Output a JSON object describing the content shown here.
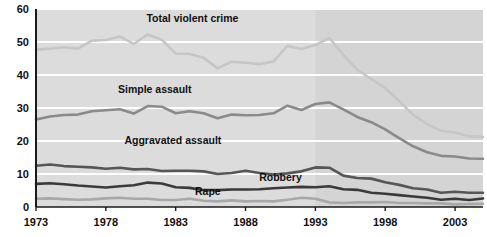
{
  "chart_data": {
    "type": "line",
    "title": "",
    "subtitle": "",
    "xlabel": "",
    "ylabel": "",
    "xlim": [
      1973,
      2005
    ],
    "ylim": [
      0,
      60
    ],
    "grid": true,
    "legend_position": "inline-annotations",
    "x_ticks": [
      "1973",
      "1978",
      "1983",
      "1988",
      "1993",
      "1998",
      "2003"
    ],
    "x_tick_values": [
      1973,
      1978,
      1983,
      1988,
      1993,
      1998,
      2003
    ],
    "y_ticks": [
      "0",
      "10",
      "20",
      "30",
      "40",
      "50",
      "60"
    ],
    "y_tick_values": [
      0,
      10,
      20,
      30,
      40,
      50,
      60
    ],
    "x": [
      1973,
      1974,
      1975,
      1976,
      1977,
      1978,
      1979,
      1980,
      1981,
      1982,
      1983,
      1984,
      1985,
      1986,
      1987,
      1988,
      1989,
      1990,
      1991,
      1992,
      1993,
      1994,
      1995,
      1996,
      1997,
      1998,
      1999,
      2000,
      2001,
      2002,
      2003,
      2004,
      2005
    ],
    "series": [
      {
        "name": "Total violent crime",
        "color": "#c6c6c6",
        "label_x": 1984.2,
        "label_y": 56.2,
        "values": [
          47.7,
          48.0,
          48.4,
          48.0,
          50.4,
          50.6,
          51.7,
          49.4,
          52.3,
          50.7,
          46.5,
          46.4,
          45.2,
          42.0,
          44.0,
          43.7,
          43.3,
          44.1,
          48.8,
          47.9,
          49.1,
          51.2,
          46.1,
          41.6,
          38.8,
          36.0,
          32.1,
          27.9,
          25.1,
          23.1,
          22.6,
          21.4,
          21.2
        ]
      },
      {
        "name": "Simple assault",
        "color": "#8a8a8a",
        "label_x": 1981.5,
        "label_y": 34.6,
        "values": [
          26.5,
          27.4,
          27.9,
          28.0,
          29.0,
          29.3,
          29.6,
          28.3,
          30.6,
          30.4,
          28.4,
          29.0,
          28.4,
          26.9,
          28.0,
          27.8,
          27.9,
          28.4,
          30.7,
          29.4,
          31.2,
          31.7,
          29.6,
          27.3,
          25.7,
          23.5,
          20.9,
          18.4,
          16.6,
          15.5,
          15.3,
          14.7,
          14.6
        ]
      },
      {
        "name": "Aggravated assault",
        "color": "#565656",
        "label_x": 1982.8,
        "label_y": 19.0,
        "values": [
          12.5,
          12.9,
          12.4,
          12.2,
          12.0,
          11.6,
          11.9,
          11.4,
          11.5,
          10.9,
          11.0,
          11.0,
          10.8,
          10.0,
          10.3,
          11.0,
          10.3,
          9.8,
          10.2,
          10.8,
          12.0,
          11.9,
          9.5,
          8.8,
          8.6,
          7.5,
          6.7,
          5.7,
          5.3,
          4.3,
          4.6,
          4.3,
          4.3
        ]
      },
      {
        "name": "Robbery",
        "color": "#3a3a3a",
        "label_x": 1990.5,
        "label_y": 8.0,
        "values": [
          7.0,
          7.2,
          6.9,
          6.5,
          6.2,
          5.9,
          6.3,
          6.6,
          7.4,
          7.1,
          6.0,
          5.8,
          5.1,
          5.1,
          5.3,
          5.3,
          5.4,
          5.7,
          5.9,
          6.1,
          6.0,
          6.3,
          5.4,
          5.2,
          4.3,
          4.0,
          3.6,
          3.2,
          2.8,
          2.2,
          2.5,
          2.1,
          2.6
        ]
      },
      {
        "name": "Rape",
        "color": "#a8a8a8",
        "label_x": 1985.3,
        "label_y": 3.6,
        "values": [
          2.5,
          2.6,
          2.4,
          2.2,
          2.3,
          2.6,
          2.8,
          2.5,
          2.5,
          2.1,
          2.1,
          2.5,
          1.9,
          1.7,
          2.0,
          1.7,
          1.8,
          1.7,
          2.2,
          2.8,
          2.5,
          1.4,
          1.2,
          1.4,
          1.4,
          1.5,
          1.2,
          1.2,
          1.1,
          1.1,
          0.8,
          0.9,
          1.0
        ]
      }
    ],
    "shaded_region": {
      "from": 1993,
      "to": 2005,
      "color": "#d4d4d4"
    },
    "plot_background": "#dcdcdc",
    "gridline_color": "#ffffff",
    "axis_color": "#1a1a1a"
  }
}
